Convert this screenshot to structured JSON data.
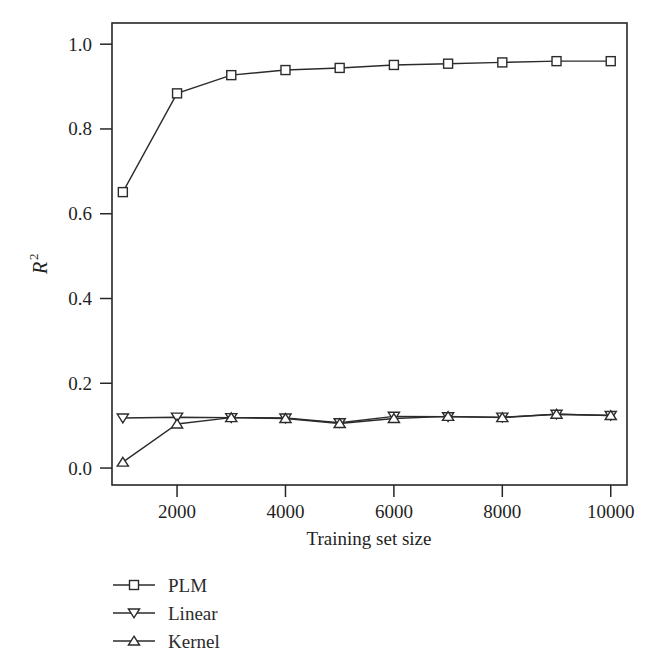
{
  "chart_data": {
    "type": "line",
    "title": "",
    "xlabel": "Training set size",
    "ylabel": "R2",
    "ylabel_base": "R",
    "ylabel_sup": "2",
    "x": [
      1000,
      2000,
      3000,
      4000,
      5000,
      6000,
      7000,
      8000,
      9000,
      10000
    ],
    "xlim": [
      800,
      10300
    ],
    "ylim": [
      -0.04,
      1.05
    ],
    "xticks": [
      2000,
      4000,
      6000,
      8000,
      10000
    ],
    "xtick_labels": [
      "2000",
      "4000",
      "6000",
      "8000",
      "10000"
    ],
    "yticks": [
      0.0,
      0.2,
      0.4,
      0.6,
      0.8,
      1.0
    ],
    "ytick_labels": [
      "0.0",
      "0.2",
      "0.4",
      "0.6",
      "0.8",
      "1.0"
    ],
    "grid": false,
    "legend_position": "below-left",
    "series": [
      {
        "name": "PLM",
        "marker": "square",
        "color": "#2b2b2b",
        "values": [
          0.651,
          0.884,
          0.927,
          0.939,
          0.944,
          0.951,
          0.954,
          0.957,
          0.96,
          0.96
        ]
      },
      {
        "name": "Linear",
        "marker": "triangle-down",
        "color": "#2b2b2b",
        "values": [
          0.118,
          0.12,
          0.119,
          0.118,
          0.107,
          0.122,
          0.121,
          0.12,
          0.127,
          0.124
        ]
      },
      {
        "name": "Kernel",
        "marker": "triangle-up",
        "color": "#2b2b2b",
        "values": [
          0.014,
          0.104,
          0.119,
          0.117,
          0.105,
          0.117,
          0.122,
          0.119,
          0.127,
          0.124
        ]
      }
    ]
  },
  "legend": {
    "items": [
      {
        "label": "PLM",
        "marker": "square"
      },
      {
        "label": "Linear",
        "marker": "triangle-down"
      },
      {
        "label": "Kernel",
        "marker": "triangle-up"
      }
    ]
  }
}
